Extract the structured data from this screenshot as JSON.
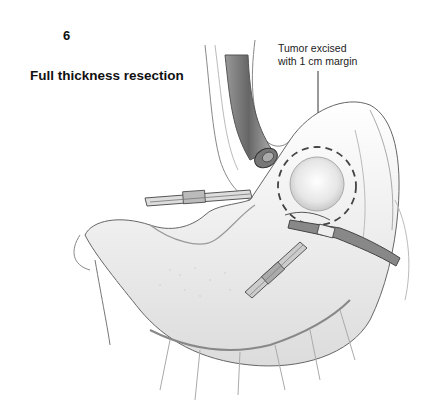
{
  "figure": {
    "panel_number": "6",
    "title": "Full thickness resection",
    "callout": {
      "line1": "Tumor excised",
      "line2": "with 1 cm margin"
    },
    "elements": [
      "esophagus-with-endoscope",
      "stomach",
      "tumor-with-dashed-margin",
      "laparoscopic-grasper-left",
      "laparoscopic-instrument-lower",
      "laparoscopic-instrument-right",
      "omental-vessels"
    ],
    "colors": {
      "line": "#555555",
      "shade": "#bbbbbb",
      "text": "#111111",
      "background": "#ffffff"
    }
  }
}
